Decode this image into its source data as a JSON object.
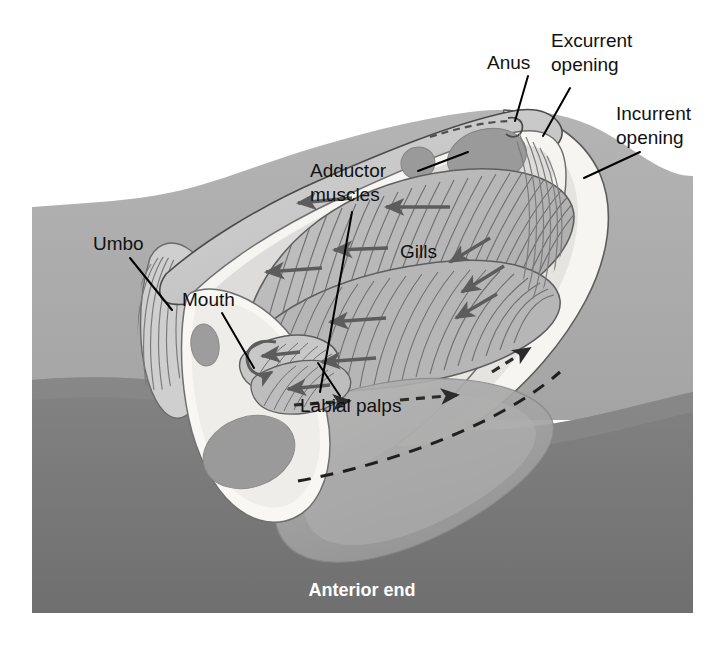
{
  "figure": {
    "orientation_label": "Anterior end",
    "background": {
      "upper_substrate_color": "#aeaeae",
      "lower_substrate_color": "#787878",
      "page_color": "#ffffff"
    }
  },
  "palette": {
    "shell_outer": "#c9c9c9",
    "shell_outline": "#4a4a4a",
    "mantle_light": "#f3f2ee",
    "mantle_mid": "#e2e1dc",
    "visceral_mass": "#c3c3c3",
    "adductor_muscle": "#9a9a9a",
    "gill_fill": "#b9b9b9",
    "gill_line": "#6f6f6f",
    "foot": "#a7a7a7",
    "arrow_solid": "#5c5c5c",
    "arrow_dashed": "#2b2b2b",
    "label_text": "#111111",
    "anterior_text": "#ffffff"
  },
  "labels": [
    {
      "id": "anus",
      "text": "Anus",
      "x": 487,
      "y": 64,
      "anchor": "start",
      "leader": "M 528 76 L 515 121",
      "points_to": "posterior dorsal anus opening"
    },
    {
      "id": "excurrent-opening",
      "text": "Excurrent",
      "text2": "opening",
      "x": 551,
      "y": 42,
      "anchor": "start",
      "leader": "M 570 88 L 543 136",
      "points_to": "excurrent siphon opening"
    },
    {
      "id": "incurrent-opening",
      "text": "Incurrent",
      "text2": "opening",
      "x": 616,
      "y": 115,
      "anchor": "start",
      "leader": "M 640 152 L 584 178",
      "points_to": "incurrent siphon opening"
    },
    {
      "id": "adductor-muscles",
      "text": "Adductor",
      "text2": "muscles",
      "x": 310,
      "y": 172,
      "anchor": "start",
      "leader": "M 418 171 L 468 152",
      "leader2": "M 352 212 L 320 392",
      "points_to": "anterior and posterior adductor muscles"
    },
    {
      "id": "gills",
      "text": "Gills",
      "x": 400,
      "y": 253,
      "anchor": "start",
      "leader": "",
      "points_to": "ctenidia / gill lamellae"
    },
    {
      "id": "umbo",
      "text": "Umbo",
      "x": 93,
      "y": 245,
      "anchor": "start",
      "leader": "M 130 258 L 172 310",
      "points_to": "umbo of shell"
    },
    {
      "id": "mouth",
      "text": "Mouth",
      "x": 182,
      "y": 301,
      "anchor": "start",
      "leader": "M 222 313 L 254 368",
      "points_to": "mouth anterior to labial palps"
    },
    {
      "id": "labial-palps",
      "text": "Labial palps",
      "x": 300,
      "y": 407,
      "anchor": "start",
      "leader": "M 340 396 L 318 363",
      "points_to": "labial palps flanking the mouth"
    }
  ],
  "caption": {
    "anterior_end": {
      "text": "Anterior end",
      "x": 362,
      "y": 591
    }
  },
  "flow_arrows": {
    "solid_note": "water current over gills (solid gray arrows)",
    "dashed_note": "water entering and leaving through siphons (dashed dark arrows)",
    "solid_count": 12,
    "dashed_count": 5
  }
}
